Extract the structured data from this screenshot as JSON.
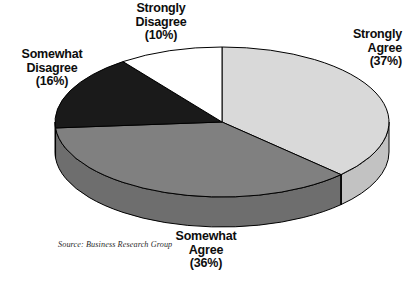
{
  "chart_data": {
    "type": "pie",
    "title": "",
    "subtitle": "",
    "xlabel": "",
    "ylabel": "",
    "legend_position": "labels-around-pie",
    "grid": false,
    "three_d": true,
    "categories": [
      "Strongly Agree",
      "Somewhat Agree",
      "Somewhat Disagree",
      "Strongly Disagree"
    ],
    "values": [
      37,
      36,
      16,
      10
    ],
    "value_unit": "%",
    "slices": [
      {
        "label": "Strongly Agree",
        "value": 37,
        "display": "Strongly\nAgree\n(37%)",
        "color": "#d9d9d9",
        "side_color": "#c2c2c2"
      },
      {
        "label": "Somewhat Agree",
        "value": 36,
        "display": "Somewhat\nAgree\n(36%)",
        "color": "#808080",
        "side_color": "#6e6e6e"
      },
      {
        "label": "Somewhat Disagree",
        "value": 16,
        "display": "Somewhat\nDisagree\n(16%)",
        "color": "#1a1a1a",
        "side_color": "#111111"
      },
      {
        "label": "Strongly Disagree",
        "value": 10,
        "display": "Strongly\nDisagree\n(10%)",
        "color": "#ffffff",
        "side_color": "#e8e8e8"
      }
    ],
    "annotations": [
      "Source: Business Research Group"
    ]
  },
  "labels": {
    "strongly_agree": "Strongly\nAgree\n(37%)",
    "somewhat_agree": "Somewhat\nAgree\n(36%)",
    "somewhat_disagree": "Somewhat\nDisagree\n(16%)",
    "strongly_disagree": "Strongly\nDisagree\n(10%)"
  },
  "source": {
    "text": "Source: Business Research Group"
  },
  "colors": {
    "background": "#ffffff",
    "outline": "#000000",
    "text": "#0d0d0d"
  }
}
